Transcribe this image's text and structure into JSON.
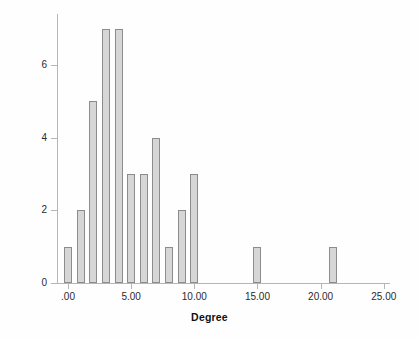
{
  "chart_data": {
    "type": "bar",
    "title": "",
    "subtitle": "",
    "xlabel": "Degree",
    "ylabel": "Count",
    "xlim": [
      -1.5,
      26.5
    ],
    "ylim": [
      0,
      7.4
    ],
    "grid": false,
    "legend": null,
    "x_tick_labels": [
      ".00",
      "5.00",
      "10.00",
      "15.00",
      "20.00",
      "25.00"
    ],
    "x_tick_values": [
      0,
      5,
      10,
      15,
      20,
      25
    ],
    "y_tick_labels": [
      "0",
      "2",
      "4",
      "6"
    ],
    "y_tick_values": [
      0,
      2,
      4,
      6
    ],
    "categories": [
      0,
      1,
      2,
      3,
      4,
      5,
      6,
      7,
      8,
      9,
      10,
      15,
      21
    ],
    "values": [
      1,
      2,
      5,
      7,
      7,
      3,
      3,
      4,
      1,
      2,
      3,
      1,
      1
    ],
    "bars": [
      {
        "x": 0,
        "count": 1
      },
      {
        "x": 1,
        "count": 2
      },
      {
        "x": 2,
        "count": 5
      },
      {
        "x": 3,
        "count": 7
      },
      {
        "x": 4,
        "count": 7
      },
      {
        "x": 5,
        "count": 3
      },
      {
        "x": 6,
        "count": 3
      },
      {
        "x": 7,
        "count": 4
      },
      {
        "x": 8,
        "count": 1
      },
      {
        "x": 9,
        "count": 2
      },
      {
        "x": 10,
        "count": 3
      },
      {
        "x": 15,
        "count": 1
      },
      {
        "x": 21,
        "count": 1
      }
    ],
    "colors": {
      "bar_fill": "#d6d6d6",
      "bar_border": "#8c8c8c",
      "axis": "#b6b6b6",
      "text": "#2b2b2b",
      "title_text": "#111111",
      "background": "#fefefe"
    }
  }
}
